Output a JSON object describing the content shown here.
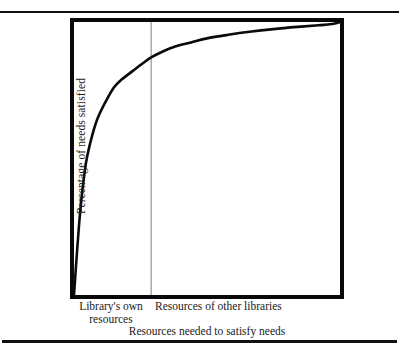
{
  "figure": {
    "background": "#ffffff",
    "ink": "#111111",
    "rules": {
      "top": "horizontal-rule",
      "bottom": "horizontal-rule"
    }
  },
  "chart_data": {
    "type": "line",
    "title": "",
    "xlabel": "Resources needed to satisfy needs",
    "ylabel": "Percentage of needs satisfied",
    "xlim": [
      0,
      100
    ],
    "ylim": [
      0,
      100
    ],
    "grid": false,
    "legend": null,
    "axis_ticks": {
      "x": [],
      "y": []
    },
    "annotations": [
      {
        "name": "divider",
        "kind": "vertical-line",
        "x": 29,
        "label": "Library's own resources / Resources of other libraries boundary",
        "color": "#8a8a8a"
      }
    ],
    "segment_labels": [
      {
        "line1": "Library's own",
        "line2": "resources",
        "x_center": 14
      },
      {
        "line1": "Resources of other libraries",
        "line2": "",
        "x_center": 63
      }
    ],
    "series": [
      {
        "name": "Percentage of needs satisfied",
        "color": "#0a0a0a",
        "x": [
          0,
          1,
          2,
          3,
          4,
          5,
          7,
          9,
          12,
          15,
          18,
          22,
          26,
          29,
          33,
          38,
          44,
          50,
          58,
          66,
          75,
          84,
          92,
          97,
          100
        ],
        "y": [
          0,
          14,
          27,
          37,
          45,
          51,
          59,
          65,
          71,
          76,
          79,
          82,
          85,
          87,
          89,
          91,
          92.5,
          94,
          95.3,
          96.4,
          97.4,
          98.2,
          98.8,
          99.3,
          100
        ]
      }
    ]
  },
  "labels": {
    "ylabel": "Percentage of needs satisfied",
    "segment_left_line1": "Library's own",
    "segment_left_line2": "resources",
    "segment_right": "Resources of other libraries",
    "xtitle": "Resources needed to satisfy needs"
  }
}
